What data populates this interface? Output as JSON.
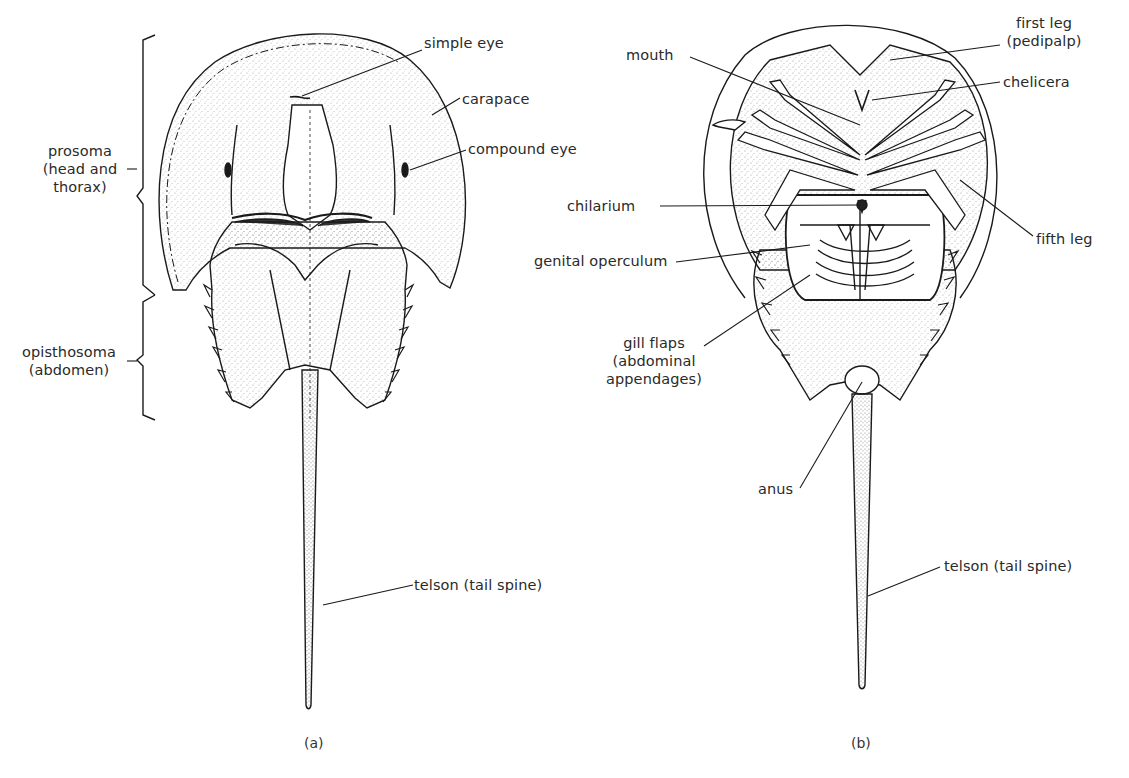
{
  "figure": {
    "panels": [
      {
        "id": "a",
        "caption": "(a)",
        "view": "dorsal",
        "labels": {
          "simple_eye": "simple eye",
          "carapace": "carapace",
          "compound_eye": "compound eye",
          "telson": "telson (tail spine)"
        },
        "brackets": {
          "prosoma_l1": "prosoma",
          "prosoma_l2": "(head and",
          "prosoma_l3": "thorax)",
          "opisthosoma_l1": "opisthosoma",
          "opisthosoma_l2": "(abdomen)"
        }
      },
      {
        "id": "b",
        "caption": "(b)",
        "view": "ventral",
        "labels": {
          "mouth": "mouth",
          "first_leg_l1": "first leg",
          "first_leg_l2": "(pedipalp)",
          "chelicera": "chelicera",
          "chilarium": "chilarium",
          "fifth_leg": "fifth leg",
          "genital_operculum": "genital operculum",
          "gill_flaps_l1": "gill flaps",
          "gill_flaps_l2": "(abdominal",
          "gill_flaps_l3": "appendages)",
          "anus": "anus",
          "telson": "telson (tail spine)"
        }
      }
    ],
    "colors": {
      "ink": "#1a1a1a",
      "text": "#2a2a2a",
      "background": "#ffffff",
      "stipple": "#555555"
    }
  }
}
